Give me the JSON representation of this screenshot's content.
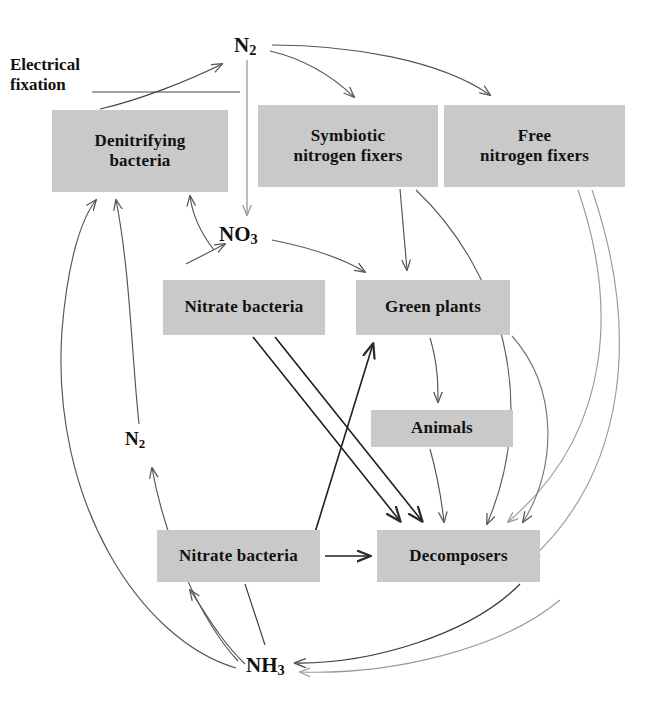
{
  "diagram": {
    "background_color": "#ffffff",
    "box_fill_color": "#c9c9c9",
    "text_color": "#111111",
    "arrow_color": "#555555",
    "width": 648,
    "height": 719
  },
  "nodes": [
    {
      "id": "denitrifying-bacteria",
      "label": "Denitrifying\nbacteria",
      "x": 52,
      "y": 110,
      "w": 176,
      "h": 82,
      "font_size": 17
    },
    {
      "id": "symbiotic-nitrogen-fixers",
      "label": "Symbiotic\nnitrogen fixers",
      "x": 258,
      "y": 105,
      "w": 180,
      "h": 82,
      "font_size": 17
    },
    {
      "id": "free-nitrogen-fixers",
      "label": "Free\nnitrogen fixers",
      "x": 444,
      "y": 105,
      "w": 181,
      "h": 82,
      "font_size": 17
    },
    {
      "id": "nitrate-bacteria-upper",
      "label": "Nitrate bacteria",
      "x": 163,
      "y": 280,
      "w": 162,
      "h": 55,
      "font_size": 17
    },
    {
      "id": "green-plants",
      "label": "Green plants",
      "x": 356,
      "y": 280,
      "w": 154,
      "h": 55,
      "font_size": 17
    },
    {
      "id": "animals",
      "label": "Animals",
      "x": 371,
      "y": 410,
      "w": 142,
      "h": 37,
      "font_size": 17
    },
    {
      "id": "nitrate-bacteria-lower",
      "label": "Nitrate bacteria",
      "x": 157,
      "y": 530,
      "w": 163,
      "h": 52,
      "font_size": 17
    },
    {
      "id": "decomposers",
      "label": "Decomposers",
      "x": 377,
      "y": 530,
      "w": 163,
      "h": 52,
      "font_size": 17
    }
  ],
  "chem_labels": [
    {
      "id": "n2-top",
      "formula": "N",
      "subscript": "2",
      "x": 234,
      "y": 33,
      "font_size": 21
    },
    {
      "id": "no3",
      "formula": "NO",
      "subscript": "3",
      "x": 219,
      "y": 222,
      "font_size": 21
    },
    {
      "id": "n2-left",
      "formula": "N",
      "subscript": "2",
      "x": 125,
      "y": 428,
      "font_size": 19
    },
    {
      "id": "nh3",
      "formula": "NH",
      "subscript": "3",
      "x": 246,
      "y": 653,
      "font_size": 21
    }
  ],
  "text_labels": [
    {
      "id": "electrical-fixation",
      "text": "Electrical\nfixation",
      "x": 10,
      "y": 55,
      "font_size": 17
    }
  ],
  "edges": [
    {
      "id": "electrical-fixation-to-n2",
      "from": "electrical-fixation",
      "to": "n2-top",
      "style": "curved"
    },
    {
      "id": "n2-to-no3",
      "from": "n2-top",
      "to": "no3",
      "style": "straight-vertical"
    },
    {
      "id": "n2-to-symbiotic-fixers",
      "from": "n2-top",
      "to": "symbiotic-nitrogen-fixers",
      "style": "curved"
    },
    {
      "id": "n2-to-free-fixers",
      "from": "n2-top",
      "to": "free-nitrogen-fixers",
      "style": "curved"
    },
    {
      "id": "no3-to-denitrifying",
      "from": "no3",
      "to": "denitrifying-bacteria",
      "style": "curved"
    },
    {
      "id": "no3-to-green-plants",
      "from": "no3",
      "to": "green-plants",
      "style": "curved"
    },
    {
      "id": "nitrate-bacteria-upper-to-no3",
      "from": "nitrate-bacteria-upper",
      "to": "no3",
      "style": "straight"
    },
    {
      "id": "symbiotic-fixers-to-green-plants",
      "from": "symbiotic-nitrogen-fixers",
      "to": "green-plants",
      "style": "straight"
    },
    {
      "id": "symbiotic-fixers-to-decomposers",
      "from": "symbiotic-nitrogen-fixers",
      "to": "decomposers",
      "style": "curved"
    },
    {
      "id": "free-fixers-to-decomposers",
      "from": "free-nitrogen-fixers",
      "to": "decomposers",
      "style": "curved"
    },
    {
      "id": "free-fixers-to-nh3",
      "from": "free-nitrogen-fixers",
      "to": "nh3",
      "style": "curved"
    },
    {
      "id": "green-plants-to-animals",
      "from": "green-plants",
      "to": "animals",
      "style": "curved"
    },
    {
      "id": "green-plants-to-decomposers",
      "from": "green-plants",
      "to": "decomposers",
      "style": "curved"
    },
    {
      "id": "animals-to-decomposers",
      "from": "animals",
      "to": "decomposers",
      "style": "curved"
    },
    {
      "id": "nitrate-bacteria-upper-to-decomposers-a",
      "from": "nitrate-bacteria-upper",
      "to": "decomposers",
      "style": "straight-diagonal"
    },
    {
      "id": "nitrate-bacteria-upper-to-decomposers-b",
      "from": "nitrate-bacteria-upper",
      "to": "decomposers",
      "style": "straight-diagonal"
    },
    {
      "id": "nitrate-bacteria-lower-to-green-plants",
      "from": "nitrate-bacteria-lower",
      "to": "green-plants",
      "style": "straight-diagonal"
    },
    {
      "id": "nitrate-bacteria-lower-to-decomposers",
      "from": "nitrate-bacteria-lower",
      "to": "decomposers",
      "style": "straight"
    },
    {
      "id": "nitrate-bacteria-lower-to-nh3",
      "from": "nitrate-bacteria-lower",
      "to": "nh3",
      "style": "straight"
    },
    {
      "id": "nh3-to-nitrate-bacteria-lower",
      "from": "nh3",
      "to": "nitrate-bacteria-lower",
      "style": "curved"
    },
    {
      "id": "nh3-to-n2-left",
      "from": "nh3",
      "to": "n2-left",
      "style": "curved"
    },
    {
      "id": "n2-left-to-denitrifying",
      "from": "n2-left",
      "to": "denitrifying-bacteria",
      "style": "curved"
    },
    {
      "id": "nh3-to-denitrifying",
      "from": "nh3",
      "to": "denitrifying-bacteria",
      "style": "curved"
    },
    {
      "id": "decomposers-to-nh3",
      "from": "decomposers",
      "to": "nh3",
      "style": "curved"
    }
  ]
}
